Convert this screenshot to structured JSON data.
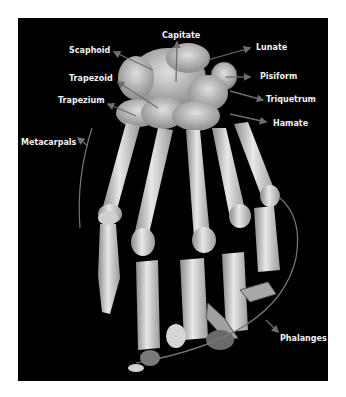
{
  "figure": {
    "title": "",
    "labels": {
      "capitate": "Capitate",
      "scaphoid": "Scaphoid",
      "lunate": "Lunate",
      "trapezoid": "Trapezoid",
      "pisiform": "Pisiform",
      "trapezium": "Trapezium",
      "triquetrum": "Triquetrum",
      "hamate": "Hamate",
      "metacarpals": "Metacarpals",
      "phalanges": "Phalanges"
    },
    "colors": {
      "background": "#000000",
      "label_text": "#f2f2f2",
      "arrow": "#6e6e6e",
      "bone": "#d8d8d8"
    }
  }
}
